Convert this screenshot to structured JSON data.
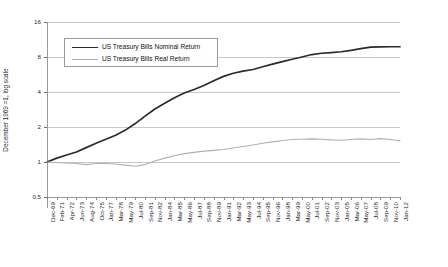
{
  "chart_data": {
    "type": "line",
    "title": "",
    "xlabel": "",
    "ylabel": "Cumulative Return December 1969 =1, log scale",
    "ylabel_lines": [
      "Cumulative Return",
      "December 1969 =1, log scale"
    ],
    "yscale": "log",
    "ylim": [
      0.5,
      16
    ],
    "yticks": [
      16,
      8,
      4,
      2,
      1,
      0.5
    ],
    "ytick_labels": [
      "16",
      "8",
      "4",
      "2",
      "1",
      "0.5"
    ],
    "grid": true,
    "legend_position": "upper-left-inside",
    "categories": [
      "Dec-69",
      "Feb-71",
      "Apr-72",
      "Jun-73",
      "Aug-74",
      "Oct-75",
      "Jan-77",
      "Mar-78",
      "May-79",
      "Jul-80",
      "Sep-81",
      "Nov-82",
      "Jan-84",
      "Mar-85",
      "May-86",
      "Jul-87",
      "Sep-88",
      "Nov-89",
      "Jan-91",
      "Mar-92",
      "May-93",
      "Jul-94",
      "Sep-95",
      "Nov-96",
      "Jan-98",
      "Mar-99",
      "May-00",
      "Jul-01",
      "Sep-02",
      "Nov-03",
      "Jan-05",
      "Mar-06",
      "May-07",
      "Jul-08",
      "Sep-09",
      "Nov-10",
      "Jan-12"
    ],
    "series": [
      {
        "name": "US Treasury Bills Nominal Return",
        "color": "#2b2b2b",
        "values": [
          1.0,
          1.08,
          1.15,
          1.22,
          1.33,
          1.45,
          1.57,
          1.7,
          1.88,
          2.14,
          2.48,
          2.86,
          3.2,
          3.57,
          3.92,
          4.2,
          4.55,
          5.0,
          5.45,
          5.8,
          6.05,
          6.25,
          6.6,
          6.95,
          7.3,
          7.65,
          8.0,
          8.4,
          8.62,
          8.74,
          8.88,
          9.12,
          9.45,
          9.72,
          9.78,
          9.8,
          9.8
        ]
      },
      {
        "name": "US Treasury Bills Real Return",
        "color": "#b0b0b0",
        "values": [
          1.0,
          0.99,
          0.98,
          0.97,
          0.95,
          0.97,
          0.97,
          0.96,
          0.94,
          0.92,
          0.95,
          1.02,
          1.08,
          1.13,
          1.18,
          1.21,
          1.24,
          1.26,
          1.28,
          1.32,
          1.36,
          1.4,
          1.45,
          1.49,
          1.53,
          1.56,
          1.57,
          1.58,
          1.57,
          1.55,
          1.54,
          1.56,
          1.58,
          1.56,
          1.59,
          1.56,
          1.52
        ]
      }
    ]
  },
  "legend": {
    "items": [
      {
        "label": "US Treasury Bills Nominal Return"
      },
      {
        "label": "US Treasury Bills Real Return"
      }
    ]
  }
}
